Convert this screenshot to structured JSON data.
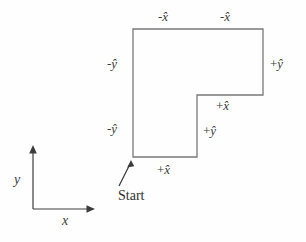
{
  "figure": {
    "background_color": "#fefefe",
    "stroke_color": "#787878",
    "text_color": "#3a3a3a",
    "axes": {
      "x_label": "x",
      "y_label": "y",
      "origin": [
        33,
        209
      ],
      "x_arrow_tip": [
        95,
        209
      ],
      "y_arrow_tip": [
        33,
        146
      ]
    },
    "start": {
      "label": "Start",
      "arrow_from": [
        119,
        186
      ],
      "arrow_to": [
        131,
        162
      ]
    },
    "path_labels": {
      "top_left": {
        "sign": "-",
        "vector": "x̂"
      },
      "top_right": {
        "sign": "-",
        "vector": "x̂"
      },
      "left_upper": {
        "sign": "-",
        "vector": "ŷ"
      },
      "left_lower": {
        "sign": "-",
        "vector": "ŷ"
      },
      "right": {
        "sign": "+",
        "vector": "ŷ"
      },
      "inner_x": {
        "sign": "+",
        "vector": "x̂"
      },
      "inner_y": {
        "sign": "+",
        "vector": "ŷ"
      },
      "bottom_x": {
        "sign": "+",
        "vector": "x̂"
      }
    },
    "polygon": {
      "description": "L-shaped closed path traversed from Start",
      "vertices": [
        [
          133,
          157
        ],
        [
          133,
          29
        ],
        [
          263,
          29
        ],
        [
          263,
          95
        ],
        [
          197,
          95
        ],
        [
          197,
          157
        ]
      ]
    }
  }
}
